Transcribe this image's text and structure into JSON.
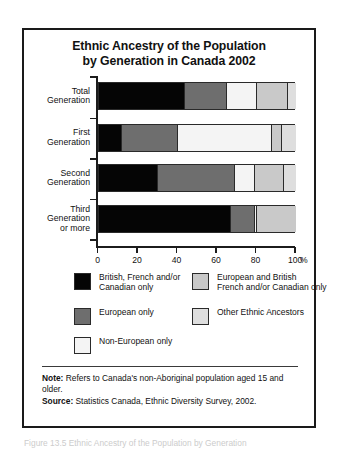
{
  "figure": {
    "title_line1": "Ethnic Ancestry of the Population",
    "title_line2": "by Generation in Canada 2002"
  },
  "notes": {
    "note_label": "Note:",
    "note_text": " Refers to Canada's non-Aboriginal population aged 15 and older.",
    "source_label": "Source:",
    "source_text": " Statistics Canada, Ethnic Diversity Survey, 2002."
  },
  "caption": "Figure 13.5 Ethnic Ancestry of the Population by Generation",
  "colors": {
    "british_french_canadian": "#050505",
    "european_only": "#6e6e6e",
    "non_european_only": "#f4f4f4",
    "european_and_british": "#c9c9c9",
    "other_ethnic": "#dedede",
    "axis": "#1c1c1c",
    "frame": "#1a1a1a"
  },
  "legend": {
    "items": [
      {
        "label": "British, French and/or\nCanadian only",
        "color": "#050505",
        "col": 0,
        "row": 0
      },
      {
        "label": "European only",
        "color": "#6e6e6e",
        "col": 0,
        "row": 1
      },
      {
        "label": "Non-European only",
        "color": "#f4f4f4",
        "col": 0,
        "row": 2
      },
      {
        "label": "European and British\nFrench and/or Canadian only",
        "color": "#c9c9c9",
        "col": 1,
        "row": 0
      },
      {
        "label": "Other Ethnic Ancestors",
        "color": "#dedede",
        "col": 1,
        "row": 1
      }
    ]
  },
  "chart_data": {
    "type": "bar",
    "orientation": "horizontal",
    "stacked": true,
    "normalized_percent": true,
    "title": "Ethnic Ancestry of the Population by Generation in Canada 2002",
    "xlabel": "%",
    "ylabel": "",
    "xlim": [
      0,
      100
    ],
    "xticks": [
      0,
      20,
      40,
      60,
      80,
      100
    ],
    "xtick_labels": [
      "0",
      "20",
      "40",
      "60",
      "80",
      "100"
    ],
    "grid": false,
    "legend_position": "below",
    "categories": [
      "Total Generation",
      "First Generation",
      "Second Generation",
      "Third Generation or more"
    ],
    "category_lines": [
      [
        "Total",
        "Generation"
      ],
      [
        "First",
        "Generation"
      ],
      [
        "Second",
        "Generation"
      ],
      [
        "Third",
        "Generation",
        "or more"
      ]
    ],
    "series": [
      {
        "name": "British, French and/or Canadian only",
        "color": "#050505",
        "values": [
          44,
          12,
          30,
          67
        ]
      },
      {
        "name": "European only",
        "color": "#6e6e6e",
        "values": [
          21,
          28,
          39,
          12
        ]
      },
      {
        "name": "Non-European only",
        "color": "#f4f4f4",
        "values": [
          15,
          48,
          10,
          1
        ]
      },
      {
        "name": "European and British French and/or Canadian only",
        "color": "#c9c9c9",
        "values": [
          16,
          5,
          15,
          20
        ]
      },
      {
        "name": "Other Ethnic Ancestors",
        "color": "#dedede",
        "values": [
          4,
          7,
          6,
          0
        ]
      }
    ]
  }
}
